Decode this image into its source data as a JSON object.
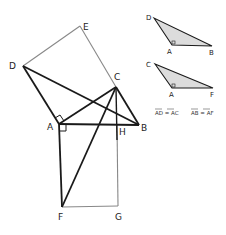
{
  "diagram": {
    "colors": {
      "thick_line": "#1a1a1a",
      "thin_line": "#888888",
      "shade": "#d9d9d9"
    },
    "main_figure": {
      "points": {
        "D": {
          "label": "D",
          "x": 23,
          "y": 66
        },
        "E": {
          "label": "E",
          "x": 80,
          "y": 26
        },
        "C": {
          "label": "C",
          "x": 116,
          "y": 87
        },
        "A": {
          "label": "A",
          "x": 59,
          "y": 124
        },
        "B": {
          "label": "B",
          "x": 139,
          "y": 125
        },
        "H": {
          "label": "H",
          "x": 117,
          "y": 125
        },
        "F": {
          "label": "F",
          "x": 62,
          "y": 207
        },
        "G": {
          "label": "G",
          "x": 118,
          "y": 206
        }
      }
    },
    "inset_top": {
      "points": {
        "D": {
          "label": "D",
          "x": 154,
          "y": 18
        },
        "A": {
          "label": "A",
          "x": 172,
          "y": 45
        },
        "B": {
          "label": "B",
          "x": 212,
          "y": 46
        }
      }
    },
    "inset_bottom": {
      "points": {
        "C": {
          "label": "C",
          "x": 155,
          "y": 64
        },
        "A": {
          "label": "A",
          "x": 172,
          "y": 88
        },
        "F": {
          "label": "F",
          "x": 213,
          "y": 88
        }
      }
    },
    "equations": {
      "eq1": "AD = AC",
      "eq2": "AB = AF"
    }
  }
}
